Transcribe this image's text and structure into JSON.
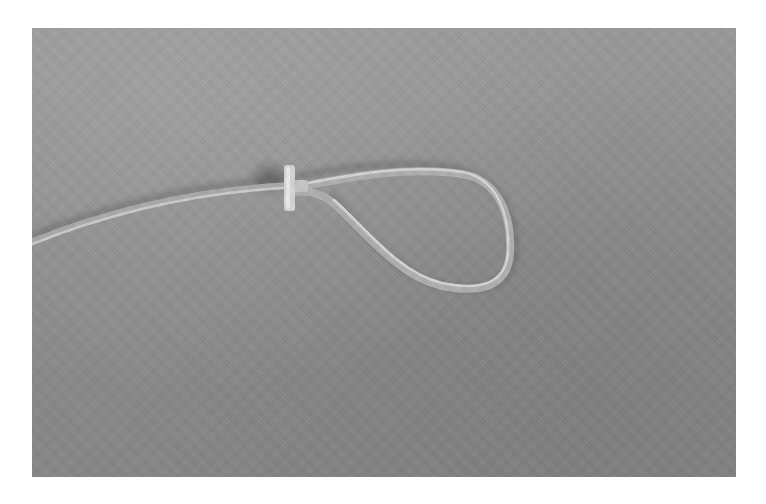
{
  "image": {
    "subject": "clear plastic tube formed into a loop, secured with a collar",
    "background": "grey fabric",
    "colors": {
      "page_background": "#ffffff",
      "fabric": "#8e8e8e",
      "tube_highlight": "#d9d9d9",
      "tube_body": "#bdbdbd",
      "shadow": "#5e5e5e",
      "collar": "#e2e2e2"
    }
  }
}
